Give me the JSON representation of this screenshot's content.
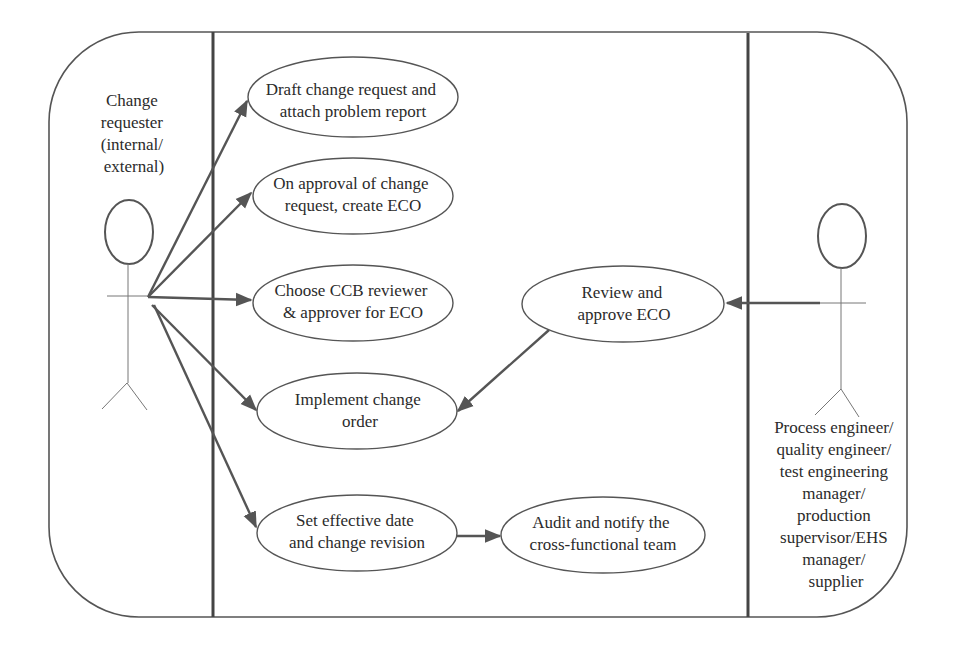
{
  "diagram": {
    "type": "use-case",
    "colors": {
      "line": "#555555",
      "text": "#2b2b2b",
      "background": "#ffffff"
    },
    "actors": [
      {
        "id": "requester",
        "lines": [
          "Change",
          "requester",
          "(internal/",
          "external)"
        ]
      },
      {
        "id": "engineer",
        "lines": [
          "Process engineer/",
          "quality engineer/",
          "test engineering",
          "manager/",
          "production",
          "supervisor/EHS",
          "manager/",
          "supplier"
        ]
      }
    ],
    "use_cases": [
      {
        "id": "draft",
        "lines": [
          "Draft change request and",
          "attach problem report"
        ]
      },
      {
        "id": "create_eco",
        "lines": [
          "On approval of change",
          "request, create ECO"
        ]
      },
      {
        "id": "choose_ccb",
        "lines": [
          "Choose CCB reviewer",
          "& approver for ECO"
        ]
      },
      {
        "id": "implement",
        "lines": [
          "Implement change",
          "order"
        ]
      },
      {
        "id": "set_date",
        "lines": [
          "Set effective date",
          "and change revision"
        ]
      },
      {
        "id": "audit",
        "lines": [
          "Audit and notify the",
          "cross-functional team"
        ]
      },
      {
        "id": "review",
        "lines": [
          "Review and",
          "approve ECO"
        ]
      }
    ],
    "associations": [
      {
        "from": "requester",
        "to": "draft"
      },
      {
        "from": "requester",
        "to": "create_eco"
      },
      {
        "from": "requester",
        "to": "choose_ccb"
      },
      {
        "from": "requester",
        "to": "implement"
      },
      {
        "from": "requester",
        "to": "set_date"
      },
      {
        "from": "set_date",
        "to": "audit"
      },
      {
        "from": "review",
        "to": "implement"
      },
      {
        "from": "engineer",
        "to": "review"
      }
    ]
  }
}
